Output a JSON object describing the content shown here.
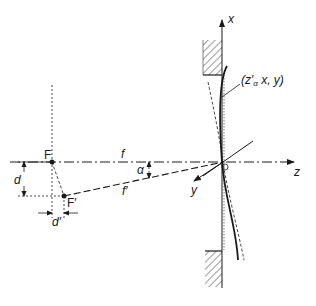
{
  "figure": {
    "colors": {
      "stroke": "#1a1a1a",
      "hatch": "#333333",
      "background": "#ffffff"
    }
  },
  "labels": {
    "axis_x": "x",
    "axis_z": "z",
    "axis_y": "y",
    "origin": "O",
    "focus": "F",
    "focus_shifted": "F′",
    "focal_length": "f",
    "focal_length_shifted": "f′",
    "angle": "α",
    "offset_d": "d",
    "offset_d_prime": "d′",
    "point_label_prefix": "(z′",
    "point_label_sub": "α",
    "point_label_suffix": " x, y)"
  }
}
